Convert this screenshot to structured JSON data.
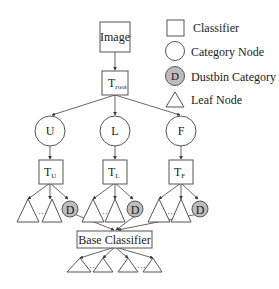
{
  "diagram": {
    "nodes": {
      "image": "Image",
      "root": {
        "main": "T",
        "sub": "root"
      },
      "categories": [
        {
          "label": "U",
          "classifier": {
            "main": "T",
            "sub": "U"
          },
          "dustbin": "D"
        },
        {
          "label": "L",
          "classifier": {
            "main": "T",
            "sub": "L"
          },
          "dustbin": "D"
        },
        {
          "label": "F",
          "classifier": {
            "main": "T",
            "sub": "F"
          },
          "dustbin": "D"
        }
      ],
      "base": "Base Classifier",
      "ellipsis": "…"
    },
    "legend": [
      {
        "shape": "square",
        "label": "Classifier"
      },
      {
        "shape": "circle",
        "label": "Category Node"
      },
      {
        "shape": "gray-circle",
        "symbol": "D",
        "label": "Dustbin Category"
      },
      {
        "shape": "triangle",
        "label": "Leaf Node"
      }
    ],
    "colors": {
      "dustbin_fill": "#bdbdbd",
      "stroke": "#555555"
    }
  }
}
